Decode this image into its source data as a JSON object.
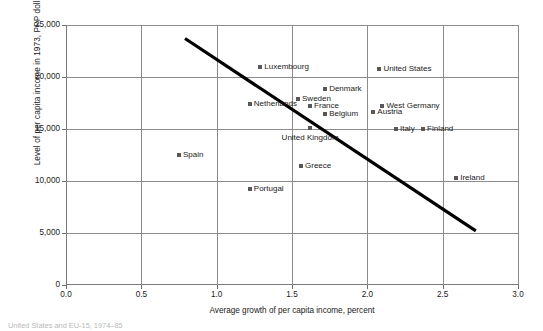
{
  "chart_data": {
    "type": "scatter",
    "title": "",
    "xlabel": "Average growth of per capita income, percent",
    "ylabel": "Level of per capita income in 1973, PPP dollars 2000",
    "xlim": [
      0.0,
      3.0
    ],
    "ylim": [
      0,
      25000
    ],
    "xticks": [
      "0.0",
      "0.5",
      "1.0",
      "1.5",
      "2.0",
      "2.5",
      "3.0"
    ],
    "xtick_values": [
      0.0,
      0.5,
      1.0,
      1.5,
      2.0,
      2.5,
      3.0
    ],
    "yticks": [
      "0",
      "5,000",
      "10,000",
      "15,000",
      "20,000",
      "25,000"
    ],
    "ytick_values": [
      0,
      5000,
      10000,
      15000,
      20000,
      25000
    ],
    "grid": "both",
    "legend": "none",
    "marker_color": "#58585a",
    "trendline_color": "#000000",
    "points": [
      {
        "label": "Luxembourg",
        "x": 1.29,
        "y": 21000,
        "label_pos": "right"
      },
      {
        "label": "United States",
        "x": 2.08,
        "y": 20800,
        "label_pos": "right"
      },
      {
        "label": "Denmark",
        "x": 1.72,
        "y": 18800,
        "label_pos": "right"
      },
      {
        "label": "Sweden",
        "x": 1.54,
        "y": 17900,
        "label_pos": "right"
      },
      {
        "label": "Netherlands",
        "x": 1.22,
        "y": 17400,
        "label_pos": "right"
      },
      {
        "label": "France",
        "x": 1.62,
        "y": 17200,
        "label_pos": "right"
      },
      {
        "label": "West Germany",
        "x": 2.1,
        "y": 17200,
        "label_pos": "right"
      },
      {
        "label": "Austria",
        "x": 2.04,
        "y": 16600,
        "label_pos": "right"
      },
      {
        "label": "Belgium",
        "x": 1.72,
        "y": 16400,
        "label_pos": "right"
      },
      {
        "label": "United Kingdom",
        "x": 1.62,
        "y": 15100,
        "label_pos": "below"
      },
      {
        "label": "Italy",
        "x": 2.19,
        "y": 15000,
        "label_pos": "right"
      },
      {
        "label": "Finland",
        "x": 2.37,
        "y": 15000,
        "label_pos": "right"
      },
      {
        "label": "Spain",
        "x": 0.75,
        "y": 12500,
        "label_pos": "right"
      },
      {
        "label": "Greece",
        "x": 1.56,
        "y": 11400,
        "label_pos": "right"
      },
      {
        "label": "Portugal",
        "x": 1.22,
        "y": 9200,
        "label_pos": "right"
      },
      {
        "label": "Ireland",
        "x": 2.59,
        "y": 10300,
        "label_pos": "right"
      }
    ],
    "trendline": {
      "x1": 0.79,
      "y1": 23700,
      "x2": 2.72,
      "y2": 5200
    }
  },
  "caption": "United States and EU-15, 1974–85"
}
